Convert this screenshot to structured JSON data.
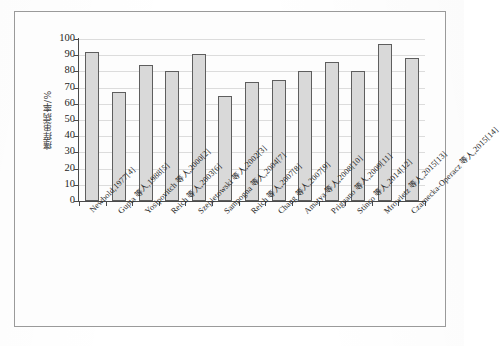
{
  "chart_data": {
    "type": "bar",
    "title": "",
    "xlabel": "",
    "ylabel": "瘙痒患病率/%",
    "ylim": [
      0,
      100
    ],
    "ytick_labels": [
      "0",
      "10",
      "20",
      "30",
      "40",
      "50",
      "60",
      "70",
      "80",
      "90",
      "100"
    ],
    "ytick_values": [
      0,
      10,
      20,
      30,
      40,
      50,
      60,
      70,
      80,
      90,
      100
    ],
    "grid": true,
    "legend": "none",
    "categories": [
      "Newbold,1977[4]",
      "Gupta 等人,1988[5]",
      "Yosipovitch 等人,2000[2]",
      "Reich 等人,2003[6]",
      "Szepietowski 等人,2002[3]",
      "Sampogna 等人,2004[7]",
      "Reich 等人,2007[8]",
      "Chang 等人,2007[9]",
      "Amatya 等人,2008[10]",
      "Prignano 等人,2009[11]",
      "Stinco 等人,2014[12]",
      "Mrowietz 等人,2015[13]",
      "Czarnecka-Operacz 等人,2015[14]"
    ],
    "values": [
      92,
      67,
      84,
      80,
      90.5,
      65,
      73.5,
      74.5,
      80,
      85.5,
      80.5,
      97,
      88.5
    ],
    "bar_fill_color": "#d9d9d9",
    "bar_edge_color": "#5e5e5e",
    "axis_color": "#4a4a4a",
    "grid_color": "#dcdcdc",
    "frame_color": "#9a9a9a",
    "background_color": "#ffffff"
  }
}
